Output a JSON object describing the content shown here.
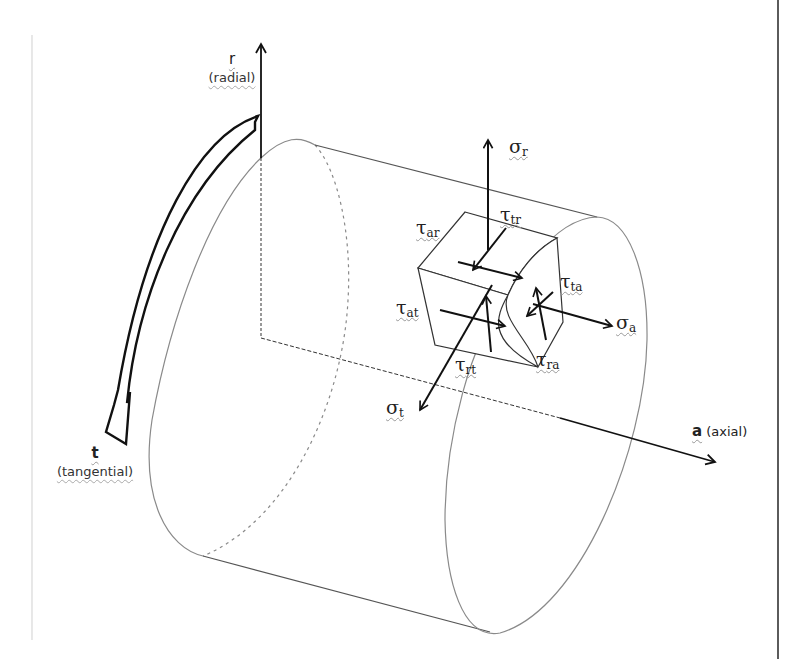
{
  "diagram": {
    "axes": {
      "radial": {
        "symbol": "r",
        "label": "(radial)"
      },
      "tangential": {
        "symbol": "t",
        "label": "(tangential)"
      },
      "axial": {
        "symbol": "a",
        "label": "(axial)"
      }
    },
    "stresses": {
      "sigma_r": {
        "base": "σ",
        "sub": "r"
      },
      "sigma_a": {
        "base": "σ",
        "sub": "a"
      },
      "sigma_t": {
        "base": "σ",
        "sub": "t"
      },
      "tau_ar": {
        "base": "τ",
        "sub": "ar"
      },
      "tau_tr": {
        "base": "τ",
        "sub": "tr"
      },
      "tau_ta": {
        "base": "τ",
        "sub": "ta"
      },
      "tau_at": {
        "base": "τ",
        "sub": "at"
      },
      "tau_rt": {
        "base": "τ",
        "sub": "rt"
      },
      "tau_ra": {
        "base": "τ",
        "sub": "ra"
      }
    },
    "colors": {
      "ink": "#111111",
      "cylinder_line": "#8a8a8a",
      "frame_left": "#d8d8d8",
      "frame_right": "#333333"
    }
  }
}
